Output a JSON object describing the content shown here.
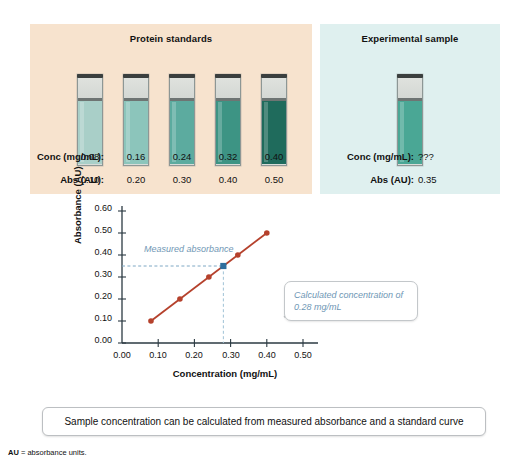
{
  "standards_panel": {
    "title": "Protein standards",
    "row_labels": {
      "conc": "Conc (mg/mL):",
      "abs": "Abs (AU):"
    },
    "tubes": [
      {
        "conc": "0.08",
        "abs": "0.10",
        "color": "#a9cfc8"
      },
      {
        "conc": "0.16",
        "abs": "0.20",
        "color": "#8cc5bb"
      },
      {
        "conc": "0.24",
        "abs": "0.30",
        "color": "#5cab9f"
      },
      {
        "conc": "0.32",
        "abs": "0.40",
        "color": "#3d9484"
      },
      {
        "conc": "0.40",
        "abs": "0.50",
        "color": "#1f6b5c"
      }
    ]
  },
  "sample_panel": {
    "title": "Experimental sample",
    "row_labels": {
      "conc": "Conc (mg/mL):",
      "abs": "Abs (AU):"
    },
    "tube": {
      "conc": "???",
      "abs": "0.35",
      "color": "#4aa795"
    }
  },
  "chart_data": {
    "type": "line",
    "title": "",
    "xlabel": "Concentration (mg/mL)",
    "ylabel": "Absorbance (AU)",
    "xlim": [
      0.0,
      0.5
    ],
    "ylim": [
      0.0,
      0.6
    ],
    "xticks": [
      "0.00",
      "0.10",
      "0.20",
      "0.30",
      "0.40",
      "0.50"
    ],
    "yticks": [
      "0.00",
      "0.10",
      "0.20",
      "0.30",
      "0.40",
      "0.50",
      "0.60"
    ],
    "grid": false,
    "legend": "none",
    "series": [
      {
        "name": "Standard curve",
        "color": "#b5412c",
        "marker": "circle",
        "x": [
          0.08,
          0.16,
          0.24,
          0.32,
          0.4
        ],
        "y": [
          0.1,
          0.2,
          0.3,
          0.4,
          0.5
        ]
      }
    ],
    "highlight_point": {
      "name": "Measured absorbance",
      "x": 0.28,
      "y": 0.35,
      "color": "#2f6f9e",
      "marker": "square"
    },
    "annotations": [
      {
        "name": "measured-absorbance",
        "text": "Measured absorbance",
        "color": "#6f97b5"
      },
      {
        "name": "calculated-concentration",
        "text": "Calculated concentration of 0.28 mg/mL",
        "color": "#6f97b5"
      }
    ]
  },
  "statement": "Sample concentration can be calculated from measured absorbance and a standard curve",
  "footnote": {
    "abbr": "AU",
    "text": "= absorbance units."
  }
}
